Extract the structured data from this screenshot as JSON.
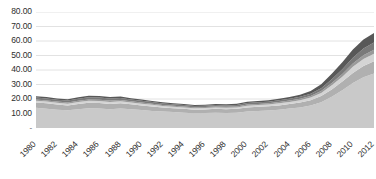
{
  "chart_data": {
    "type": "area",
    "stacked": true,
    "title": "",
    "xlabel": "",
    "ylabel": "",
    "ylim": [
      0,
      80
    ],
    "ytick_step": 10,
    "grid": true,
    "legend": "none",
    "xtick_rotation": -45,
    "ytick_labels": [
      "80.00",
      "70.00",
      "60.00",
      "50.00",
      "40.00",
      "30.00",
      "20.00",
      "10.00",
      "-"
    ],
    "ytick_values": [
      80,
      70,
      60,
      50,
      40,
      30,
      20,
      10,
      0
    ],
    "categories": [
      "1980",
      "1981",
      "1982",
      "1983",
      "1984",
      "1985",
      "1986",
      "1987",
      "1988",
      "1989",
      "1990",
      "1991",
      "1992",
      "1993",
      "1994",
      "1995",
      "1996",
      "1997",
      "1998",
      "1999",
      "2000",
      "2001",
      "2002",
      "2003",
      "2004",
      "2005",
      "2006",
      "2007",
      "2008",
      "2009",
      "2010",
      "2011",
      "2012"
    ],
    "xtick_labels": [
      "1980",
      "1982",
      "1984",
      "1986",
      "1988",
      "1990",
      "1992",
      "1994",
      "1996",
      "1998",
      "2000",
      "2002",
      "2004",
      "2006",
      "2008",
      "2010",
      "2012"
    ],
    "series": [
      {
        "name": "Series 1",
        "color": "#c9c9c9",
        "values": [
          14.0,
          13.2,
          12.6,
          12.2,
          13.0,
          13.6,
          13.4,
          13.0,
          13.4,
          13.0,
          12.4,
          11.8,
          11.4,
          11.0,
          10.6,
          10.2,
          10.4,
          10.6,
          10.4,
          10.6,
          11.4,
          11.8,
          12.0,
          12.6,
          13.4,
          14.2,
          15.6,
          17.8,
          21.6,
          26.0,
          31.0,
          35.0,
          37.6
        ]
      },
      {
        "name": "Series 2",
        "color": "#b0b0b0",
        "values": [
          3.6,
          3.8,
          3.6,
          3.4,
          3.6,
          3.8,
          3.8,
          3.6,
          3.6,
          3.4,
          3.2,
          3.0,
          2.8,
          2.6,
          2.6,
          2.4,
          2.4,
          2.6,
          2.6,
          2.6,
          2.8,
          2.8,
          3.0,
          3.0,
          3.2,
          3.4,
          3.6,
          4.2,
          5.0,
          6.0,
          7.0,
          7.8,
          8.4
        ]
      },
      {
        "name": "Series 3",
        "color": "#d4d4d4",
        "values": [
          1.2,
          1.2,
          1.2,
          1.2,
          1.4,
          1.4,
          1.4,
          1.4,
          1.4,
          1.2,
          1.2,
          1.2,
          1.0,
          1.0,
          1.0,
          1.0,
          1.0,
          1.0,
          1.0,
          1.0,
          1.2,
          1.2,
          1.2,
          1.4,
          1.4,
          1.6,
          1.8,
          2.2,
          2.8,
          3.4,
          4.2,
          4.8,
          5.2
        ]
      },
      {
        "name": "Series 4",
        "color": "#9a9a9a",
        "values": [
          0.8,
          0.8,
          0.8,
          0.8,
          0.8,
          0.9,
          0.9,
          0.9,
          0.9,
          0.8,
          0.8,
          0.8,
          0.7,
          0.7,
          0.7,
          0.7,
          0.7,
          0.7,
          0.7,
          0.7,
          0.8,
          0.8,
          0.8,
          0.9,
          0.9,
          1.0,
          1.1,
          1.3,
          1.6,
          1.9,
          2.3,
          2.6,
          2.8
        ]
      },
      {
        "name": "Series 5",
        "color": "#7a7a7a",
        "values": [
          1.4,
          1.4,
          1.3,
          1.3,
          1.4,
          1.5,
          1.5,
          1.4,
          1.4,
          1.3,
          1.2,
          1.1,
          1.0,
          1.0,
          0.9,
          0.9,
          0.9,
          0.9,
          0.9,
          1.0,
          1.0,
          1.1,
          1.1,
          1.2,
          1.3,
          1.4,
          1.6,
          2.0,
          2.6,
          3.2,
          4.0,
          4.6,
          5.0
        ]
      },
      {
        "name": "Series 6",
        "color": "#585858",
        "values": [
          0.9,
          0.9,
          0.9,
          0.9,
          1.0,
          1.0,
          1.0,
          1.0,
          1.0,
          0.9,
          0.9,
          0.8,
          0.8,
          0.8,
          0.7,
          0.7,
          0.7,
          0.7,
          0.8,
          0.8,
          0.9,
          0.9,
          1.0,
          1.1,
          1.2,
          1.4,
          1.8,
          2.6,
          3.8,
          4.8,
          5.6,
          6.2,
          6.6
        ]
      }
    ],
    "totals": [
      21.9,
      21.3,
      20.4,
      19.8,
      21.2,
      22.2,
      22.0,
      21.3,
      21.7,
      20.6,
      19.7,
      18.7,
      17.7,
      17.1,
      16.5,
      15.9,
      16.1,
      16.5,
      16.4,
      16.7,
      18.1,
      18.6,
      19.1,
      20.2,
      21.4,
      23.0,
      25.5,
      30.1,
      37.4,
      45.3,
      54.1,
      61.0,
      65.6
    ],
    "colors": {
      "gridline": "#e2e2e2",
      "plot_background": "#ffffff",
      "tick_text": "#2e2e2e"
    }
  }
}
